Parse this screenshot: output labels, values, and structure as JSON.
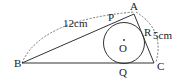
{
  "diagram": {
    "type": "geometry",
    "points": {
      "A": {
        "label": "A",
        "x": 134,
        "y": 14
      },
      "B": {
        "label": "B",
        "x": 22,
        "y": 63
      },
      "C": {
        "label": "C",
        "x": 154,
        "y": 63
      },
      "P": {
        "label": "P",
        "x": 112,
        "y": 23
      },
      "Q": {
        "label": "Q",
        "x": 124,
        "y": 63
      },
      "R": {
        "label": "R",
        "x": 143,
        "y": 36
      },
      "O": {
        "label": "O",
        "x": 124,
        "y": 43
      }
    },
    "circle": {
      "center": "O",
      "r": 20
    },
    "measurements": {
      "AB": "12cm",
      "AC": "5cm"
    },
    "colors": {
      "line": "#333333",
      "dashed": "#666666",
      "text": "#222222"
    }
  }
}
